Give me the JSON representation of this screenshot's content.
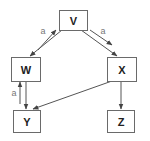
{
  "diagram": {
    "nodes": [
      {
        "id": "V",
        "label": "V"
      },
      {
        "id": "W",
        "label": "W"
      },
      {
        "id": "X",
        "label": "X"
      },
      {
        "id": "Y",
        "label": "Y"
      },
      {
        "id": "Z",
        "label": "Z"
      }
    ],
    "edges": [
      {
        "from": "V",
        "to": "W",
        "label": ""
      },
      {
        "from": "W",
        "to": "V",
        "label": "a"
      },
      {
        "from": "V",
        "to": "X",
        "label": ""
      },
      {
        "from": "V",
        "to": "X",
        "label": "a",
        "parallel": true
      },
      {
        "from": "W",
        "to": "Y",
        "label": ""
      },
      {
        "from": "Y",
        "to": "W",
        "label": "a"
      },
      {
        "from": "X",
        "to": "Y",
        "label": ""
      },
      {
        "from": "X",
        "to": "Z",
        "label": ""
      }
    ],
    "edge_labels": {
      "wv": "a",
      "vx": "a",
      "yw": "a"
    }
  }
}
